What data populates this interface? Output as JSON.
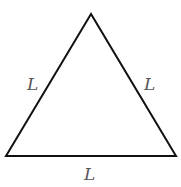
{
  "diagram": {
    "type": "equilateral-triangle",
    "vertices": {
      "top": [
        91,
        14
      ],
      "bottom_left": [
        6,
        156
      ],
      "bottom_right": [
        176,
        156
      ]
    },
    "stroke_color": "#111111",
    "labels": {
      "left_side": "L",
      "right_side": "L",
      "bottom_side": "L"
    }
  }
}
